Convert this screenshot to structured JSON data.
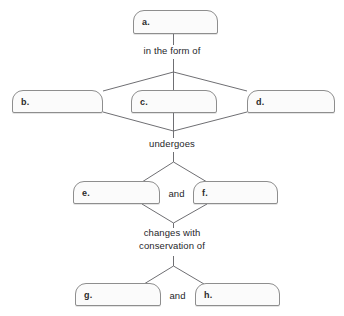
{
  "diagram": {
    "type": "concept-map-worksheet",
    "title": "",
    "nodes": [
      {
        "id": "a",
        "label": "a.",
        "x": 133,
        "y": 10,
        "w": 85,
        "h": 24
      },
      {
        "id": "b",
        "label": "b.",
        "x": 12,
        "y": 90,
        "w": 91,
        "h": 23
      },
      {
        "id": "c",
        "label": "c.",
        "x": 131,
        "y": 90,
        "w": 86,
        "h": 23
      },
      {
        "id": "d",
        "label": "d.",
        "x": 247,
        "y": 90,
        "w": 88,
        "h": 23
      },
      {
        "id": "e",
        "label": "e.",
        "x": 73,
        "y": 181,
        "w": 87,
        "h": 23
      },
      {
        "id": "f",
        "label": "f.",
        "x": 193,
        "y": 181,
        "w": 85,
        "h": 23
      },
      {
        "id": "g",
        "label": "g.",
        "x": 75,
        "y": 283,
        "w": 86,
        "h": 23
      },
      {
        "id": "h",
        "label": "h.",
        "x": 195,
        "y": 283,
        "w": 85,
        "h": 23
      }
    ],
    "edge_labels": [
      {
        "id": "in-the-form-of",
        "text": "in the form of",
        "x": 119,
        "y": 45,
        "w": 106
      },
      {
        "id": "undergoes",
        "text": "undergoes",
        "x": 126,
        "y": 138,
        "w": 92
      },
      {
        "id": "changes-with-conservation-of",
        "text": "changes with\nconservation of",
        "x": 107,
        "y": 227,
        "w": 130
      }
    ],
    "conjunction_labels": [
      {
        "id": "and-ef",
        "text": "and",
        "x": 160,
        "y": 188,
        "w": 33
      },
      {
        "id": "and-gh",
        "text": "and",
        "x": 161,
        "y": 290,
        "w": 33
      }
    ],
    "colors": {
      "page_background": "#ffffff",
      "box_fill": "#fbfbfb",
      "box_stroke": "#8e8e8e",
      "connector_stroke": "#6f6f73",
      "text": "#26262a",
      "letter_text": "#2b2b2b"
    }
  }
}
